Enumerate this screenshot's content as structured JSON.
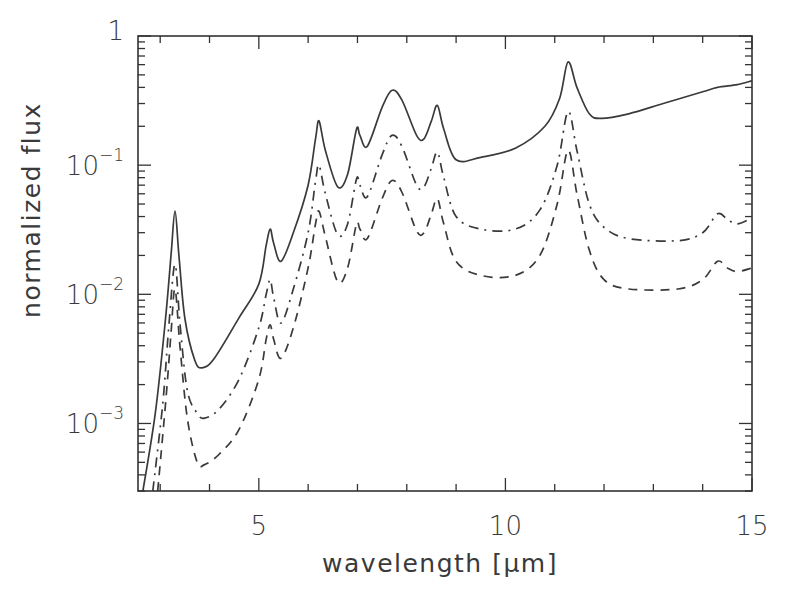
{
  "chart_data": {
    "type": "line",
    "title": "",
    "xlabel": "wavelength [μm]",
    "ylabel": "normalized flux",
    "xscale": "linear",
    "yscale": "log",
    "xlim": [
      2.55,
      15.0
    ],
    "ylim": [
      0.0003,
      1.0
    ],
    "grid": false,
    "legend": null,
    "x_ticks": [
      {
        "value": 5,
        "label": "5"
      },
      {
        "value": 10,
        "label": "10"
      },
      {
        "value": 15,
        "label": "15"
      }
    ],
    "x_minor_step": 1,
    "y_ticks": [
      {
        "value": 1,
        "base": "1",
        "exp": ""
      },
      {
        "value": 0.1,
        "base": "10",
        "exp": "−1"
      },
      {
        "value": 0.01,
        "base": "10",
        "exp": "−2"
      },
      {
        "value": 0.001,
        "base": "10",
        "exp": "−3"
      }
    ],
    "series": [
      {
        "name": "solid",
        "style": "solid",
        "points": [
          [
            2.65,
            0.0003
          ],
          [
            2.9,
            0.0012
          ],
          [
            3.1,
            0.006
          ],
          [
            3.22,
            0.02
          ],
          [
            3.3,
            0.044
          ],
          [
            3.38,
            0.02
          ],
          [
            3.5,
            0.0065
          ],
          [
            3.7,
            0.0031
          ],
          [
            3.85,
            0.0027
          ],
          [
            4.1,
            0.0032
          ],
          [
            4.6,
            0.0066
          ],
          [
            5.0,
            0.012
          ],
          [
            5.15,
            0.024
          ],
          [
            5.23,
            0.032
          ],
          [
            5.3,
            0.025
          ],
          [
            5.45,
            0.018
          ],
          [
            5.7,
            0.03
          ],
          [
            6.0,
            0.07
          ],
          [
            6.15,
            0.16
          ],
          [
            6.22,
            0.22
          ],
          [
            6.35,
            0.13
          ],
          [
            6.6,
            0.068
          ],
          [
            6.8,
            0.085
          ],
          [
            6.98,
            0.19
          ],
          [
            7.05,
            0.17
          ],
          [
            7.2,
            0.14
          ],
          [
            7.5,
            0.28
          ],
          [
            7.7,
            0.38
          ],
          [
            7.9,
            0.32
          ],
          [
            8.2,
            0.17
          ],
          [
            8.35,
            0.16
          ],
          [
            8.5,
            0.22
          ],
          [
            8.62,
            0.29
          ],
          [
            8.75,
            0.19
          ],
          [
            9.0,
            0.11
          ],
          [
            9.5,
            0.115
          ],
          [
            10.2,
            0.135
          ],
          [
            10.8,
            0.2
          ],
          [
            11.1,
            0.33
          ],
          [
            11.27,
            0.63
          ],
          [
            11.45,
            0.4
          ],
          [
            11.7,
            0.25
          ],
          [
            11.95,
            0.23
          ],
          [
            12.5,
            0.25
          ],
          [
            13.2,
            0.3
          ],
          [
            14.0,
            0.37
          ],
          [
            14.3,
            0.4
          ],
          [
            14.7,
            0.42
          ],
          [
            15.0,
            0.45
          ]
        ]
      },
      {
        "name": "dash-dot",
        "style": "dashdot",
        "points": [
          [
            2.85,
            0.0003
          ],
          [
            3.05,
            0.0014
          ],
          [
            3.18,
            0.006
          ],
          [
            3.3,
            0.017
          ],
          [
            3.4,
            0.006
          ],
          [
            3.55,
            0.0018
          ],
          [
            3.75,
            0.0012
          ],
          [
            3.9,
            0.0011
          ],
          [
            4.2,
            0.0013
          ],
          [
            4.6,
            0.0022
          ],
          [
            5.0,
            0.0055
          ],
          [
            5.15,
            0.01
          ],
          [
            5.23,
            0.013
          ],
          [
            5.3,
            0.0095
          ],
          [
            5.45,
            0.006
          ],
          [
            5.7,
            0.011
          ],
          [
            6.0,
            0.03
          ],
          [
            6.15,
            0.075
          ],
          [
            6.22,
            0.1
          ],
          [
            6.35,
            0.06
          ],
          [
            6.6,
            0.029
          ],
          [
            6.8,
            0.035
          ],
          [
            6.98,
            0.078
          ],
          [
            7.05,
            0.07
          ],
          [
            7.2,
            0.057
          ],
          [
            7.5,
            0.12
          ],
          [
            7.7,
            0.17
          ],
          [
            7.9,
            0.14
          ],
          [
            8.2,
            0.07
          ],
          [
            8.35,
            0.068
          ],
          [
            8.5,
            0.095
          ],
          [
            8.62,
            0.126
          ],
          [
            8.75,
            0.08
          ],
          [
            9.0,
            0.04
          ],
          [
            9.5,
            0.032
          ],
          [
            10.2,
            0.032
          ],
          [
            10.7,
            0.045
          ],
          [
            11.05,
            0.1
          ],
          [
            11.27,
            0.26
          ],
          [
            11.45,
            0.13
          ],
          [
            11.7,
            0.05
          ],
          [
            12.0,
            0.033
          ],
          [
            12.5,
            0.027
          ],
          [
            13.5,
            0.026
          ],
          [
            14.0,
            0.03
          ],
          [
            14.3,
            0.042
          ],
          [
            14.5,
            0.038
          ],
          [
            14.7,
            0.035
          ],
          [
            15.0,
            0.039
          ]
        ]
      },
      {
        "name": "dashed",
        "style": "dashed",
        "points": [
          [
            2.95,
            0.0003
          ],
          [
            3.12,
            0.0016
          ],
          [
            3.22,
            0.005
          ],
          [
            3.3,
            0.011
          ],
          [
            3.4,
            0.004
          ],
          [
            3.55,
            0.0011
          ],
          [
            3.75,
            0.0005
          ],
          [
            3.9,
            0.00048
          ],
          [
            4.2,
            0.00058
          ],
          [
            4.6,
            0.0009
          ],
          [
            5.0,
            0.0022
          ],
          [
            5.15,
            0.0045
          ],
          [
            5.23,
            0.0058
          ],
          [
            5.3,
            0.0045
          ],
          [
            5.45,
            0.0032
          ],
          [
            5.7,
            0.0055
          ],
          [
            6.0,
            0.016
          ],
          [
            6.15,
            0.035
          ],
          [
            6.22,
            0.044
          ],
          [
            6.35,
            0.028
          ],
          [
            6.6,
            0.0125
          ],
          [
            6.8,
            0.016
          ],
          [
            6.98,
            0.035
          ],
          [
            7.05,
            0.032
          ],
          [
            7.2,
            0.027
          ],
          [
            7.5,
            0.055
          ],
          [
            7.7,
            0.076
          ],
          [
            7.9,
            0.062
          ],
          [
            8.2,
            0.031
          ],
          [
            8.35,
            0.03
          ],
          [
            8.5,
            0.042
          ],
          [
            8.62,
            0.055
          ],
          [
            8.75,
            0.035
          ],
          [
            9.0,
            0.018
          ],
          [
            9.5,
            0.014
          ],
          [
            10.2,
            0.014
          ],
          [
            10.7,
            0.02
          ],
          [
            11.05,
            0.05
          ],
          [
            11.27,
            0.13
          ],
          [
            11.45,
            0.06
          ],
          [
            11.7,
            0.022
          ],
          [
            12.0,
            0.013
          ],
          [
            12.5,
            0.011
          ],
          [
            13.5,
            0.011
          ],
          [
            14.0,
            0.013
          ],
          [
            14.3,
            0.018
          ],
          [
            14.5,
            0.016
          ],
          [
            14.7,
            0.015
          ],
          [
            15.0,
            0.016
          ]
        ]
      }
    ]
  }
}
